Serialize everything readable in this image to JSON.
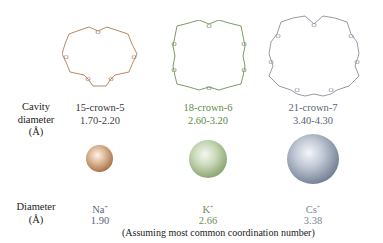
{
  "row_labels": {
    "cavity": [
      "Cavity",
      "diameter",
      "(Å)"
    ],
    "diameter": [
      "Diameter",
      "(Å)"
    ]
  },
  "crowns": [
    {
      "name": "15-crown-5",
      "cavity_diameter": "1.70-2.20",
      "color": "#b07a55",
      "oxygens": 5
    },
    {
      "name": "18-crown-6",
      "cavity_diameter": "2.60-3.20",
      "color": "#6f8f55",
      "oxygens": 6
    },
    {
      "name": "21-crown-7",
      "cavity_diameter": "3.40-4.30",
      "color": "#7c8594",
      "oxygens": 7
    }
  ],
  "ions": [
    {
      "symbol": "Na",
      "charge": "+",
      "diameter": "1.90",
      "color": "#b07a55"
    },
    {
      "symbol": "K",
      "charge": "+",
      "diameter": "2.66",
      "color": "#6f8f55"
    },
    {
      "symbol": "Cs",
      "charge": "+",
      "diameter": "3.38",
      "color": "#5a6478"
    }
  ],
  "footnote": "(Assuming most common coordination number)",
  "ring_atom_label": "O"
}
